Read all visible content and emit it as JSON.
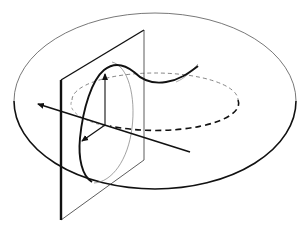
{
  "diagram": {
    "colors": {
      "background": "#ffffff",
      "stroke_dark": "#111111",
      "stroke_light": "#8a8a8a"
    },
    "elements": [
      {
        "id": "outer-boundary",
        "type": "ellipse",
        "label": "torus outer rim"
      },
      {
        "id": "core-circle",
        "type": "dashed-ellipse",
        "label": "torus core circle"
      },
      {
        "id": "cutting-plane",
        "type": "parallelogram",
        "label": "vertical section plane"
      },
      {
        "id": "cross-section",
        "type": "curve",
        "label": "meridional section curve"
      },
      {
        "id": "axis-line",
        "type": "arrow",
        "label": "axis through section"
      },
      {
        "id": "vertical-vector",
        "type": "arrow",
        "label": "vertical vector"
      },
      {
        "id": "radial-vector",
        "type": "arrow",
        "label": "radial vector"
      }
    ]
  }
}
